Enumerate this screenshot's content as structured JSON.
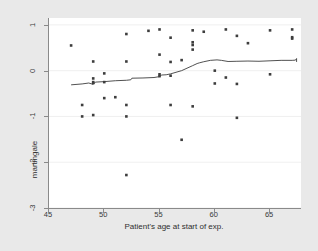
{
  "chart_data": {
    "type": "scatter",
    "title": "",
    "xlabel": "Patient's age at start of exp.",
    "ylabel": "martingale",
    "xlim": [
      45.0,
      67.8
    ],
    "ylim": [
      -3.0,
      1.15
    ],
    "xticks": [
      45,
      50,
      55,
      60,
      65
    ],
    "xticklabels": [
      "45",
      "50",
      "55",
      "60",
      "65"
    ],
    "yticks": [
      1,
      0,
      -1,
      -2,
      -3
    ],
    "yticklabels": [
      "1",
      "0",
      "-1",
      "-2",
      "-3"
    ],
    "grid": "horizontal-faint",
    "legend": "none",
    "marker": "filled-square",
    "marker_color": "#3d3d3d",
    "line_color": "#3d3d3d",
    "plot_bg": "#ffffff",
    "figure_bg": "#e9e9e9",
    "axis_color": "#8a8a8a",
    "series": [
      {
        "name": "martingale residuals",
        "type": "scatter",
        "points": [
          [
            47.0,
            0.55
          ],
          [
            48.0,
            -0.75
          ],
          [
            48.0,
            -1.0
          ],
          [
            49.0,
            0.2
          ],
          [
            49.0,
            -0.17
          ],
          [
            49.0,
            -0.25
          ],
          [
            49.0,
            -0.27
          ],
          [
            49.0,
            -0.97
          ],
          [
            50.0,
            -0.06
          ],
          [
            50.0,
            -0.25
          ],
          [
            50.0,
            -0.6
          ],
          [
            51.0,
            -0.58
          ],
          [
            52.0,
            0.8
          ],
          [
            52.0,
            0.2
          ],
          [
            52.0,
            -0.75
          ],
          [
            52.0,
            -1.0
          ],
          [
            52.0,
            -2.28
          ],
          [
            54.0,
            0.87
          ],
          [
            55.0,
            0.9
          ],
          [
            55.0,
            0.35
          ],
          [
            55.0,
            -0.08
          ],
          [
            55.0,
            -0.12
          ],
          [
            56.0,
            0.72
          ],
          [
            56.0,
            0.19
          ],
          [
            56.0,
            -0.11
          ],
          [
            56.0,
            -0.75
          ],
          [
            57.0,
            0.23
          ],
          [
            57.0,
            -1.51
          ],
          [
            58.0,
            0.88
          ],
          [
            58.0,
            0.62
          ],
          [
            58.0,
            0.56
          ],
          [
            58.0,
            0.46
          ],
          [
            58.0,
            -0.78
          ],
          [
            59.0,
            0.85
          ],
          [
            60.0,
            0.0
          ],
          [
            60.0,
            -0.28
          ],
          [
            61.0,
            0.9
          ],
          [
            61.0,
            -0.15
          ],
          [
            62.0,
            0.76
          ],
          [
            62.0,
            -0.29
          ],
          [
            62.0,
            -1.03
          ],
          [
            63.0,
            0.6
          ],
          [
            65.0,
            0.88
          ],
          [
            65.0,
            -0.08
          ],
          [
            67.0,
            0.9
          ],
          [
            67.0,
            0.73
          ],
          [
            67.0,
            0.7
          ]
        ]
      },
      {
        "name": "lowess smoother",
        "type": "line",
        "points": [
          [
            47.0,
            -0.31
          ],
          [
            48.0,
            -0.29
          ],
          [
            48.6,
            -0.27
          ],
          [
            49.0,
            -0.3
          ],
          [
            49.2,
            -0.25
          ],
          [
            50.0,
            -0.24
          ],
          [
            51.0,
            -0.22
          ],
          [
            52.0,
            -0.21
          ],
          [
            52.4,
            -0.2
          ],
          [
            52.5,
            -0.165
          ],
          [
            53.5,
            -0.16
          ],
          [
            54.5,
            -0.15
          ],
          [
            55.0,
            -0.13
          ],
          [
            55.2,
            -0.095
          ],
          [
            55.6,
            -0.09
          ],
          [
            56.0,
            -0.07
          ],
          [
            57.0,
            0.0
          ],
          [
            58.0,
            0.11
          ],
          [
            58.4,
            0.155
          ],
          [
            58.6,
            0.17
          ],
          [
            59.0,
            0.195
          ],
          [
            59.6,
            0.225
          ],
          [
            60.2,
            0.235
          ],
          [
            60.6,
            0.225
          ],
          [
            61.2,
            0.2
          ],
          [
            62.0,
            0.205
          ],
          [
            63.0,
            0.21
          ],
          [
            64.0,
            0.205
          ],
          [
            65.0,
            0.215
          ],
          [
            66.0,
            0.225
          ],
          [
            67.0,
            0.225
          ],
          [
            67.3,
            0.23
          ],
          [
            67.4,
            0.265
          ],
          [
            67.4,
            0.19
          ]
        ]
      }
    ]
  }
}
